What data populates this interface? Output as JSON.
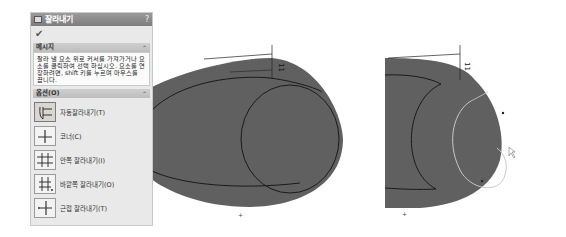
{
  "panel": {
    "title": "잘라내기",
    "help": "?",
    "ok_icon": "✔",
    "message_section": {
      "label": "메시지",
      "text": "잘라 낼 요소 위로 커서를 가져가거나 요소를 클릭하여 선택 하십시오. 요소를 연장하려면, shift 키를 누르며 마우스를 끕니다."
    },
    "options_section": {
      "label": "옵션(O)",
      "options": [
        {
          "label": "자동잘라내기(T)",
          "icon": "power-trim-icon",
          "selected": true
        },
        {
          "label": "코너(C)",
          "icon": "corner-trim-icon",
          "selected": false
        },
        {
          "label": "안쪽 잘라내기(I)",
          "icon": "trim-inside-icon",
          "selected": false
        },
        {
          "label": "바깥쪽 잘라내기(O)",
          "icon": "trim-outside-icon",
          "selected": false
        },
        {
          "label": "근접 잘라내기(T)",
          "icon": "trim-closest-icon",
          "selected": false
        }
      ]
    }
  },
  "drawings": {
    "dimension_value": "11",
    "fill_color": "#606060",
    "line_color": "#1a1a1a",
    "highlight_color": "#c8c8c8"
  }
}
